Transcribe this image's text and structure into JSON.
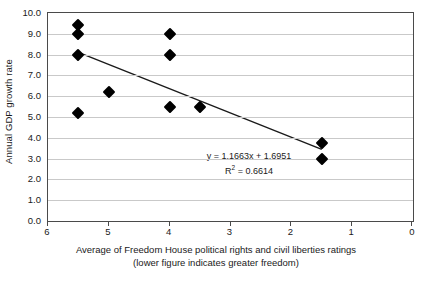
{
  "chart_data": {
    "type": "scatter",
    "title": "",
    "xlabel": "Average of Freedom House political rights and civil liberties ratings",
    "xlabel_line2": "(lower figure indicates greater freedom)",
    "ylabel": "Annual GDP growth rate",
    "xlim": [
      6,
      0
    ],
    "ylim": [
      0,
      10
    ],
    "x_axis_reversed": true,
    "xticks": [
      6,
      5,
      4,
      3,
      2,
      1,
      0
    ],
    "xtick_labels": [
      "6",
      "5",
      "4",
      "3",
      "2",
      "1",
      "0"
    ],
    "yticks": [
      0,
      1,
      2,
      3,
      4,
      5,
      6,
      7,
      8,
      9,
      10
    ],
    "ytick_labels": [
      "0.0",
      "1.0",
      "2.0",
      "3.0",
      "4.0",
      "5.0",
      "6.0",
      "7.0",
      "8.0",
      "9.0",
      "10.0"
    ],
    "grid": "horizontal",
    "legend": "none",
    "marker_style": "filled-diamond",
    "marker_color": "#000000",
    "gridline_color": "#c9c9c9",
    "axis_color": "#4a4a4a",
    "points": [
      {
        "x": 5.5,
        "y": 9.4
      },
      {
        "x": 5.5,
        "y": 9.0
      },
      {
        "x": 5.5,
        "y": 8.0
      },
      {
        "x": 5.5,
        "y": 5.2
      },
      {
        "x": 5.0,
        "y": 6.2
      },
      {
        "x": 4.0,
        "y": 9.0
      },
      {
        "x": 4.0,
        "y": 8.0
      },
      {
        "x": 4.0,
        "y": 5.5
      },
      {
        "x": 3.5,
        "y": 5.5
      },
      {
        "x": 1.5,
        "y": 3.75
      },
      {
        "x": 1.5,
        "y": 3.0
      }
    ],
    "trendline": {
      "equation_text": "y = 1.1663x + 1.6951",
      "r_squared_label": "R",
      "r_squared_exponent": "2",
      "r_squared_text": " = 0.6614",
      "slope": 1.1663,
      "intercept": 1.6951,
      "r_squared": 0.6614,
      "x_start": 5.5,
      "y_start": 8.11,
      "x_end": 1.5,
      "y_end": 3.44,
      "color": "#1a1a1a"
    }
  }
}
